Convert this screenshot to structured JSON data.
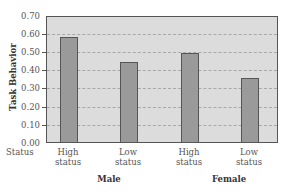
{
  "chart_data": {
    "type": "bar",
    "title": "",
    "ylabel": "Task Behavior",
    "xlabel": "",
    "ylim": [
      0,
      0.7
    ],
    "yticks": [
      "0.70",
      "0.60",
      "0.50",
      "0.40",
      "0.30",
      "0.20",
      "0.10",
      "0.00"
    ],
    "grid": true,
    "x_axis_row_label": "Status",
    "groups": [
      {
        "name": "Male",
        "categories": [
          {
            "label_line1": "High",
            "label_line2": "status",
            "value": 0.59
          },
          {
            "label_line1": "Low",
            "label_line2": "status",
            "value": 0.45
          }
        ]
      },
      {
        "name": "Female",
        "categories": [
          {
            "label_line1": "High",
            "label_line2": "status",
            "value": 0.5
          },
          {
            "label_line1": "Low",
            "label_line2": "status",
            "value": 0.36
          }
        ]
      }
    ],
    "categories": [
      "Male High status",
      "Male Low status",
      "Female High status",
      "Female Low status"
    ],
    "values": [
      0.59,
      0.45,
      0.5,
      0.36
    ],
    "colors": {
      "bar": "#9a9a9a",
      "plot_bg": "#dcdcdc",
      "border": "#555555"
    }
  }
}
